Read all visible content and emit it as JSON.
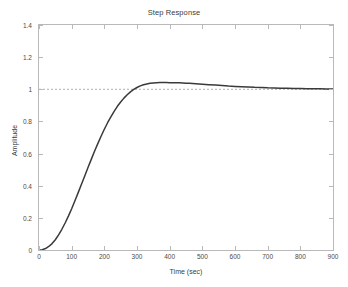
{
  "chart_data": {
    "type": "line",
    "title": "Step Response",
    "xlabel": "Time (sec)",
    "ylabel": "Amplitude",
    "xlim": [
      0,
      900
    ],
    "ylim": [
      0,
      1.4
    ],
    "xticks": [
      0,
      100,
      200,
      300,
      400,
      500,
      600,
      700,
      800,
      900
    ],
    "xtick_labels": [
      "0",
      "100",
      "200",
      "300",
      "400",
      "500",
      "600",
      "700",
      "800",
      "900"
    ],
    "yticks": [
      0,
      0.2,
      0.4,
      0.6,
      0.8,
      1,
      1.2,
      1.4
    ],
    "ytick_labels": [
      "0",
      "0.2",
      "0.4",
      "0.6",
      "0.8",
      "1",
      "1.2",
      "1.4"
    ],
    "grid": false,
    "legend": null,
    "line_color": "#3a3a3a",
    "reference_line": {
      "name": "steady-state-reference",
      "y": 1,
      "style": "dashed",
      "color": "#b0b0b0"
    },
    "series": [
      {
        "name": "Step Response",
        "color": "#3a3a3a",
        "x": [
          0,
          10,
          20,
          30,
          40,
          50,
          60,
          70,
          80,
          90,
          100,
          110,
          120,
          130,
          140,
          150,
          160,
          170,
          180,
          190,
          200,
          210,
          220,
          230,
          240,
          250,
          260,
          270,
          280,
          290,
          300,
          310,
          320,
          330,
          340,
          350,
          360,
          370,
          380,
          390,
          400,
          410,
          420,
          430,
          440,
          450,
          460,
          470,
          480,
          500,
          520,
          540,
          560,
          580,
          600,
          620,
          640,
          660,
          680,
          700,
          720,
          740,
          760,
          780,
          800,
          820,
          840,
          860,
          880,
          900
        ],
        "y": [
          0,
          0.002,
          0.009,
          0.022,
          0.04,
          0.064,
          0.094,
          0.129,
          0.168,
          0.211,
          0.257,
          0.306,
          0.357,
          0.409,
          0.461,
          0.513,
          0.564,
          0.614,
          0.662,
          0.708,
          0.751,
          0.792,
          0.829,
          0.863,
          0.894,
          0.921,
          0.945,
          0.966,
          0.984,
          0.999,
          1.011,
          1.021,
          1.028,
          1.033,
          1.037,
          1.039,
          1.041,
          1.042,
          1.042,
          1.042,
          1.041,
          1.041,
          1.04,
          1.04,
          1.039,
          1.038,
          1.037,
          1.036,
          1.035,
          1.032,
          1.029,
          1.026,
          1.023,
          1.02,
          1.018,
          1.016,
          1.014,
          1.012,
          1.011,
          1.009,
          1.008,
          1.007,
          1.006,
          1.005,
          1.005,
          1.004,
          1.003,
          1.003,
          1.002,
          1.002
        ]
      }
    ],
    "annotations": {
      "peak_value": 1.042,
      "peak_time": 380,
      "steady_state": 1.0
    }
  }
}
